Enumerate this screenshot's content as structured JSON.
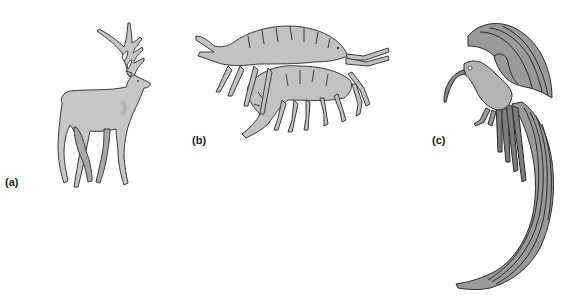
{
  "figure": {
    "panels": [
      {
        "id": "a",
        "label": "(a)",
        "subject": "red deer stag"
      },
      {
        "id": "b",
        "label": "(b)",
        "subject": "amphipod crustaceans (mating pair)"
      },
      {
        "id": "c",
        "label": "(c)",
        "subject": "bird of paradise"
      }
    ]
  },
  "colors": {
    "background": "#ffffff",
    "deer_fill": "#c6c6c6",
    "deer_shade": "#a8a8a8",
    "amphipod_fill": "#c2c2c2",
    "bird_fill": "#9a9a9a",
    "bird_dark": "#7d7d7d",
    "outline": "#3a3a3a",
    "label_text": "#222222"
  }
}
